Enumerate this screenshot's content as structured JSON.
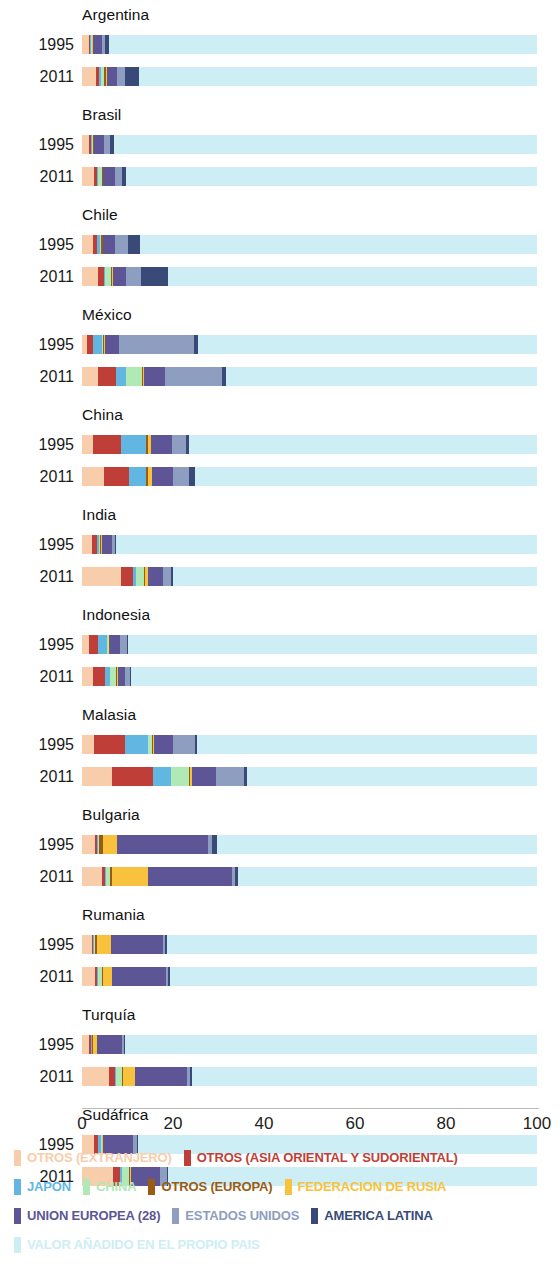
{
  "chart_data": {
    "type": "bar",
    "subtype": "stacked-horizontal-100",
    "title": "",
    "xlabel": "",
    "ylabel": "",
    "xlim": [
      0,
      100
    ],
    "xticks": [
      0,
      20,
      40,
      60,
      80,
      100
    ],
    "grid": false,
    "legend_position": "bottom",
    "axis": {
      "x_origin_px": 82,
      "x_span_px": 455,
      "ticks": [
        "0",
        "20",
        "40",
        "60",
        "80",
        "100"
      ]
    },
    "series": [
      {
        "name": "OTROS (EXTRANJERO)",
        "key": "otros_extranjero",
        "color": "#f8cdab"
      },
      {
        "name": "OTROS (ASIA ORIENTAL Y SUDORIENTAL)",
        "key": "otros_asia",
        "color": "#bf3f38"
      },
      {
        "name": "JAPON",
        "key": "japon",
        "color": "#62b6e2"
      },
      {
        "name": "CHINA",
        "key": "china",
        "color": "#b0e8b6"
      },
      {
        "name": "OTROS (EUROPA)",
        "key": "otros_europa",
        "color": "#9a5b12"
      },
      {
        "name": "FEDERACION DE RUSIA",
        "key": "rusia",
        "color": "#f8c23c"
      },
      {
        "name": "UNION EUROPEA (28)",
        "key": "union_europea",
        "color": "#5d5596"
      },
      {
        "name": "ESTADOS UNIDOS",
        "key": "estados_unidos",
        "color": "#8e9ec0"
      },
      {
        "name": "AMERICA LATINA",
        "key": "america_latina",
        "color": "#3a4a78"
      },
      {
        "name": "VALOR AÑADIDO EN EL PROPIO PAIS",
        "key": "propio_pais",
        "color": "#cdeef5"
      }
    ],
    "categories": [
      "Argentina",
      "Brasil",
      "Chile",
      "México",
      "China",
      "India",
      "Indonesia",
      "Malasia",
      "Bulgaria",
      "Rumania",
      "Turquía",
      "Sudáfrica"
    ],
    "years": [
      "1995",
      "2011"
    ],
    "countries": [
      {
        "name": "Argentina",
        "rows": [
          {
            "year": "1995",
            "values": {
              "otros_extranjero": 1.5,
              "otros_asia": 0.2,
              "japon": 0.2,
              "china": 0.2,
              "otros_europa": 0.2,
              "rusia": 0.1,
              "union_europea": 2.1,
              "estados_unidos": 0.5,
              "america_latina": 0.9
            }
          },
          {
            "year": "2011",
            "values": {
              "otros_extranjero": 3.0,
              "otros_asia": 0.8,
              "japon": 0.3,
              "china": 0.8,
              "otros_europa": 0.3,
              "rusia": 0.2,
              "union_europea": 2.3,
              "estados_unidos": 1.8,
              "america_latina": 3.0
            }
          }
        ]
      },
      {
        "name": "Brasil",
        "rows": [
          {
            "year": "1995",
            "values": {
              "otros_extranjero": 1.6,
              "otros_asia": 0.3,
              "japon": 0.4,
              "china": 0.1,
              "otros_europa": 0.2,
              "rusia": 0.1,
              "union_europea": 2.2,
              "estados_unidos": 1.2,
              "america_latina": 0.9
            }
          },
          {
            "year": "2011",
            "values": {
              "otros_extranjero": 2.6,
              "otros_asia": 0.6,
              "japon": 0.3,
              "china": 0.9,
              "otros_europa": 0.2,
              "rusia": 0.1,
              "union_europea": 2.5,
              "estados_unidos": 1.6,
              "america_latina": 0.9
            }
          }
        ]
      },
      {
        "name": "Chile",
        "rows": [
          {
            "year": "1995",
            "values": {
              "otros_extranjero": 2.5,
              "otros_asia": 0.9,
              "japon": 0.5,
              "china": 0.2,
              "otros_europa": 0.5,
              "rusia": 0.1,
              "union_europea": 2.5,
              "estados_unidos": 3.0,
              "america_latina": 2.6
            }
          },
          {
            "year": "2011",
            "values": {
              "otros_extranjero": 3.6,
              "otros_asia": 1.2,
              "japon": 0.3,
              "china": 1.3,
              "otros_europa": 0.3,
              "rusia": 0.1,
              "union_europea": 2.8,
              "estados_unidos": 3.4,
              "america_latina": 6.0
            }
          }
        ]
      },
      {
        "name": "México",
        "rows": [
          {
            "year": "1995",
            "values": {
              "otros_extranjero": 1.0,
              "otros_asia": 1.4,
              "japon": 2.0,
              "china": 0.2,
              "otros_europa": 0.3,
              "rusia": 0.1,
              "union_europea": 3.1,
              "estados_unidos": 16.5,
              "america_latina": 0.8
            }
          },
          {
            "year": "2011",
            "values": {
              "otros_extranjero": 3.5,
              "otros_asia": 4.0,
              "japon": 2.2,
              "china": 3.4,
              "otros_europa": 0.3,
              "rusia": 0.2,
              "union_europea": 4.6,
              "estados_unidos": 12.5,
              "america_latina": 1.0
            }
          }
        ]
      },
      {
        "name": "China",
        "rows": [
          {
            "year": "1995",
            "values": {
              "otros_extranjero": 2.4,
              "otros_asia": 6.2,
              "japon": 5.5,
              "china": 0.0,
              "otros_europa": 0.3,
              "rusia": 0.8,
              "union_europea": 4.5,
              "estados_unidos": 3.2,
              "america_latina": 0.7
            }
          },
          {
            "year": "2011",
            "values": {
              "otros_extranjero": 4.8,
              "otros_asia": 5.5,
              "japon": 3.8,
              "china": 0.0,
              "otros_europa": 0.3,
              "rusia": 1.0,
              "union_europea": 4.6,
              "estados_unidos": 3.5,
              "america_latina": 1.4
            }
          }
        ]
      },
      {
        "name": "India",
        "rows": [
          {
            "year": "1995",
            "values": {
              "otros_extranjero": 2.3,
              "otros_asia": 1.0,
              "japon": 0.5,
              "china": 0.2,
              "otros_europa": 0.2,
              "rusia": 0.2,
              "union_europea": 2.3,
              "estados_unidos": 0.5,
              "america_latina": 0.2
            }
          },
          {
            "year": "2011",
            "values": {
              "otros_extranjero": 8.6,
              "otros_asia": 2.6,
              "japon": 0.6,
              "china": 1.8,
              "otros_europa": 0.3,
              "rusia": 0.5,
              "union_europea": 3.4,
              "estados_unidos": 1.8,
              "america_latina": 0.3
            }
          }
        ]
      },
      {
        "name": "Indonesia",
        "rows": [
          {
            "year": "1995",
            "values": {
              "otros_extranjero": 1.6,
              "otros_asia": 1.9,
              "japon": 2.1,
              "china": 0.3,
              "otros_europa": 0.2,
              "rusia": 0.1,
              "union_europea": 2.2,
              "estados_unidos": 1.4,
              "america_latina": 0.3
            }
          },
          {
            "year": "2011",
            "values": {
              "otros_extranjero": 2.5,
              "otros_asia": 2.5,
              "japon": 1.2,
              "china": 1.2,
              "otros_europa": 0.2,
              "rusia": 0.3,
              "union_europea": 1.6,
              "estados_unidos": 1.0,
              "america_latina": 0.3
            }
          }
        ]
      },
      {
        "name": "Malasia",
        "rows": [
          {
            "year": "1995",
            "values": {
              "otros_extranjero": 2.6,
              "otros_asia": 6.8,
              "japon": 5.0,
              "china": 1.0,
              "otros_europa": 0.3,
              "rusia": 0.1,
              "union_europea": 4.3,
              "estados_unidos": 4.8,
              "america_latina": 0.4
            }
          },
          {
            "year": "2011",
            "values": {
              "otros_extranjero": 6.5,
              "otros_asia": 9.0,
              "japon": 4.0,
              "china": 4.0,
              "otros_europa": 0.3,
              "rusia": 0.4,
              "union_europea": 5.2,
              "estados_unidos": 6.2,
              "america_latina": 0.6
            }
          }
        ]
      },
      {
        "name": "Bulgaria",
        "rows": [
          {
            "year": "1995",
            "values": {
              "otros_extranjero": 2.8,
              "otros_asia": 0.5,
              "japon": 0.2,
              "china": 0.3,
              "otros_europa": 0.8,
              "rusia": 3.0,
              "union_europea": 20.0,
              "estados_unidos": 1.0,
              "america_latina": 1.0
            }
          },
          {
            "year": "2011",
            "values": {
              "otros_extranjero": 4.4,
              "otros_asia": 0.6,
              "japon": 0.2,
              "china": 0.9,
              "otros_europa": 0.5,
              "rusia": 7.8,
              "union_europea": 18.5,
              "estados_unidos": 0.8,
              "america_latina": 0.6
            }
          }
        ]
      },
      {
        "name": "Rumania",
        "rows": [
          {
            "year": "1995",
            "values": {
              "otros_extranjero": 2.1,
              "otros_asia": 0.4,
              "japon": 0.2,
              "china": 0.2,
              "otros_europa": 0.5,
              "rusia": 2.9,
              "union_europea": 11.4,
              "estados_unidos": 0.6,
              "america_latina": 0.4
            }
          },
          {
            "year": "2011",
            "values": {
              "otros_extranjero": 2.9,
              "otros_asia": 0.5,
              "japon": 0.2,
              "china": 0.8,
              "otros_europa": 0.3,
              "rusia": 2.0,
              "union_europea": 11.7,
              "estados_unidos": 0.6,
              "america_latina": 0.3
            }
          }
        ]
      },
      {
        "name": "Turquía",
        "rows": [
          {
            "year": "1995",
            "values": {
              "otros_extranjero": 1.6,
              "otros_asia": 0.3,
              "japon": 0.2,
              "china": 0.1,
              "otros_europa": 0.3,
              "rusia": 0.9,
              "union_europea": 5.4,
              "estados_unidos": 0.5,
              "america_latina": 0.2
            }
          },
          {
            "year": "2011",
            "values": {
              "otros_extranjero": 6.0,
              "otros_asia": 1.2,
              "japon": 0.3,
              "china": 1.3,
              "otros_europa": 0.3,
              "rusia": 2.6,
              "union_europea": 11.3,
              "estados_unidos": 0.7,
              "america_latina": 0.4
            }
          }
        ]
      },
      {
        "name": "Sudáfrica",
        "rows": [
          {
            "year": "1995",
            "values": {
              "otros_extranjero": 2.7,
              "otros_asia": 0.8,
              "japon": 0.6,
              "china": 0.2,
              "otros_europa": 0.2,
              "rusia": 0.1,
              "union_europea": 6.6,
              "estados_unidos": 0.9,
              "america_latina": 0.3
            }
          },
          {
            "year": "2011",
            "values": {
              "otros_extranjero": 6.8,
              "otros_asia": 1.5,
              "japon": 0.4,
              "china": 1.6,
              "otros_europa": 0.2,
              "rusia": 0.2,
              "union_europea": 6.4,
              "estados_unidos": 1.5,
              "america_latina": 0.4
            }
          }
        ]
      }
    ]
  },
  "legend": {
    "rows": [
      [
        {
          "label": "OTROS (EXTRANJERO)",
          "color": "#f8cdab"
        },
        {
          "label": "OTROS (ASIA ORIENTAL Y SUDORIENTAL)",
          "color": "#bf3f38"
        }
      ],
      [
        {
          "label": "JAPON",
          "color": "#62b6e2"
        },
        {
          "label": "CHINA",
          "color": "#b0e8b6"
        },
        {
          "label": "OTROS (EUROPA)",
          "color": "#9a5b12"
        },
        {
          "label": "FEDERACION DE RUSIA",
          "color": "#f8c23c"
        }
      ],
      [
        {
          "label": "UNION EUROPEA (28)",
          "color": "#5d5596"
        },
        {
          "label": "ESTADOS UNIDOS",
          "color": "#8e9ec0"
        },
        {
          "label": "AMERICA LATINA",
          "color": "#3a4a78"
        }
      ],
      [
        {
          "label": "VALOR AÑADIDO EN EL PROPIO PAIS",
          "color": "#cdeef5"
        }
      ]
    ]
  }
}
